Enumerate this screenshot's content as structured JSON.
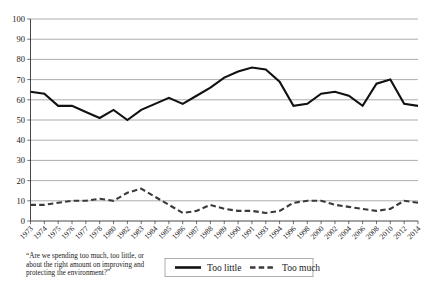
{
  "chart_data": {
    "type": "line",
    "title": "",
    "subtitle": "",
    "xlabel": "",
    "ylabel": "",
    "ylim": [
      0,
      100
    ],
    "ytick_step": 10,
    "yticks": [
      0,
      10,
      20,
      30,
      40,
      50,
      60,
      70,
      80,
      90,
      100
    ],
    "grid": true,
    "legend_position": "bottom-center",
    "categories": [
      "1973",
      "1974",
      "1975",
      "1976",
      "1977",
      "1978",
      "1980",
      "1982",
      "1983",
      "1984",
      "1985",
      "1986",
      "1987",
      "1988",
      "1989",
      "1990",
      "1991",
      "1993",
      "1994",
      "1996",
      "1998",
      "2000",
      "2002",
      "2004",
      "2006",
      "2008",
      "2010",
      "2012",
      "2014"
    ],
    "series": [
      {
        "name": "Too little",
        "style": "solid",
        "color": "#111111",
        "values": [
          64,
          63,
          57,
          57,
          54,
          51,
          55,
          50,
          55,
          58,
          61,
          58,
          62,
          66,
          71,
          74,
          76,
          75,
          69,
          57,
          58,
          63,
          64,
          62,
          57,
          68,
          70,
          58,
          57
        ]
      },
      {
        "name": "Too much",
        "style": "dashed",
        "color": "#3a3a3a",
        "values": [
          8,
          8,
          9,
          10,
          10,
          11,
          10,
          14,
          16,
          12,
          8,
          4,
          5,
          8,
          6,
          5,
          5,
          4,
          5,
          9,
          10,
          10,
          8,
          7,
          6,
          5,
          6,
          10,
          9
        ]
      }
    ],
    "xtick_label_rotation": -45
  },
  "caption": {
    "lines": [
      "“Are we spending too much, too little, or",
      "about the right amount on improving and",
      "protecting the environment?”"
    ]
  },
  "legend": {
    "entries": [
      {
        "label": "Too little",
        "style": "solid"
      },
      {
        "label": "Too much",
        "style": "dashed"
      }
    ]
  },
  "colors": {
    "gridline": "#8a8a8a",
    "axis": "#333333",
    "too_little": "#111111",
    "too_much": "#3a3a3a",
    "background": "#ffffff"
  }
}
